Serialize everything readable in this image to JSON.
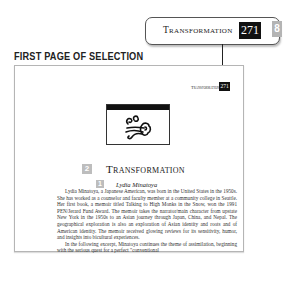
{
  "callout": {
    "title": "Transformation",
    "page_number": "271",
    "badge": "8"
  },
  "section_label": "FIRST PAGE OF SELECTION",
  "page": {
    "running_head": "Transformation",
    "running_page_number": "271",
    "emblem_icon": "wind-swirl-ornament",
    "chapter_badge": "2",
    "chapter_title": "Transformation",
    "author_badge": "1",
    "author": "Lydia Minatoya",
    "paragraphs": [
      "Lydia Minatoya, a Japanese American, was born in the United States in the 1950s. She has worked as a counselor and faculty member at a community college in Seattle. Her first book, a memoir titled Talking to High Monks in the Snow, won the 1991 PEN/Jerard Fund Award. The memoir takes the narrator/main character from upstate New York in the 1950s to an Asian journey through Japan, China, and Nepal. The geographical exploration is also an exploration of Asian identity and roots and of American identity. The memoir received glowing reviews for its sensitivity, humor, and insights into bicultural experiences.",
      "In the following excerpt, Minatoya continues the theme of assimilation, beginning with the serious quest for a perfect \"conventional"
    ]
  }
}
